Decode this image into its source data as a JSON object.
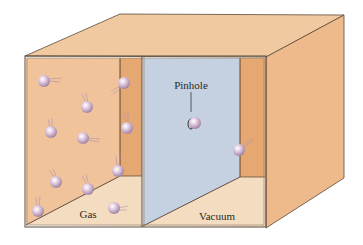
{
  "diagram": {
    "labels": {
      "gas": "Gas",
      "vacuum": "Vacuum",
      "pinhole": "Pinhole"
    },
    "chambers": [
      {
        "name": "gas-chamber",
        "label": "Gas",
        "molecule_count": 13
      },
      {
        "name": "vacuum-chamber",
        "label": "Vacuum",
        "molecule_count": 2
      }
    ],
    "colors": {
      "top_face": "#f0c9a0",
      "right_face": "#eeb98b",
      "gas_back_wall": "#f2c9a1",
      "inner_side_wall": "#e6a873",
      "partition": "#c5d0e0",
      "floor": "#f4dcc0",
      "molecule": "#d8bfd8",
      "edge": "#5a4a3a"
    }
  }
}
